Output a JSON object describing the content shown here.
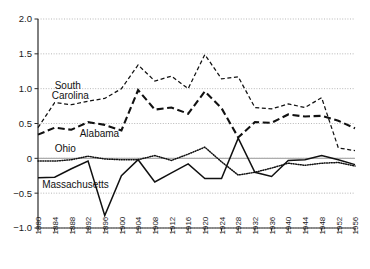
{
  "chart_data": {
    "type": "line",
    "title": "",
    "xlabel": "",
    "ylabel": "",
    "ylim": [
      -1.0,
      2.0
    ],
    "xlim": [
      1880,
      1956
    ],
    "grid": true,
    "legend": "inline-labels",
    "y_ticks": [
      "2.0",
      "1.5",
      "1.0",
      "0.5",
      "0",
      "-0.5",
      "-1.0"
    ],
    "y_tick_values": [
      2.0,
      1.5,
      1.0,
      0.5,
      0,
      -0.5,
      -1.0
    ],
    "x": [
      1880,
      1884,
      1888,
      1892,
      1896,
      1900,
      1904,
      1908,
      1912,
      1916,
      1920,
      1924,
      1928,
      1932,
      1936,
      1940,
      1944,
      1948,
      1952,
      1956
    ],
    "x_tick_labels": [
      "1880",
      "1884",
      "1888",
      "1892",
      "1896",
      "1900",
      "1904",
      "1908",
      "1912",
      "1916",
      "1920",
      "1924",
      "1928",
      "1932",
      "1936",
      "1940",
      "1944",
      "1948",
      "1952",
      "1956"
    ],
    "series": [
      {
        "name": "South Carolina",
        "style": "fine-dashed",
        "label_x": 1884,
        "label_y": 1.0,
        "values": [
          0.44,
          0.8,
          0.77,
          0.82,
          0.86,
          1.0,
          1.34,
          1.11,
          1.18,
          1.0,
          1.49,
          1.14,
          1.17,
          0.73,
          0.71,
          0.78,
          0.73,
          0.87,
          0.15,
          0.11
        ]
      },
      {
        "name": "Alabama",
        "style": "bold-dashed",
        "label_x": 1890,
        "label_y": 0.31,
        "values": [
          0.34,
          0.44,
          0.41,
          0.52,
          0.48,
          0.4,
          0.98,
          0.7,
          0.73,
          0.64,
          0.96,
          0.72,
          0.3,
          0.52,
          0.51,
          0.63,
          0.6,
          0.61,
          0.54,
          0.43
        ]
      },
      {
        "name": "Ohio",
        "style": "dotted",
        "label_x": 1884,
        "label_y": 0.09,
        "values": [
          -0.04,
          -0.04,
          -0.02,
          0.03,
          -0.01,
          -0.02,
          -0.02,
          0.04,
          -0.03,
          0.06,
          0.16,
          -0.05,
          -0.24,
          -0.2,
          -0.14,
          -0.07,
          -0.1,
          -0.07,
          -0.06,
          -0.11
        ]
      },
      {
        "name": "Massachusetts",
        "style": "solid",
        "label_x": 1881,
        "label_y": -0.42,
        "values": [
          -0.28,
          -0.27,
          -0.15,
          -0.04,
          -0.82,
          -0.25,
          -0.02,
          -0.34,
          -0.21,
          -0.08,
          -0.29,
          -0.29,
          0.29,
          -0.2,
          -0.26,
          -0.03,
          -0.02,
          0.04,
          -0.02,
          -0.09
        ]
      }
    ]
  }
}
